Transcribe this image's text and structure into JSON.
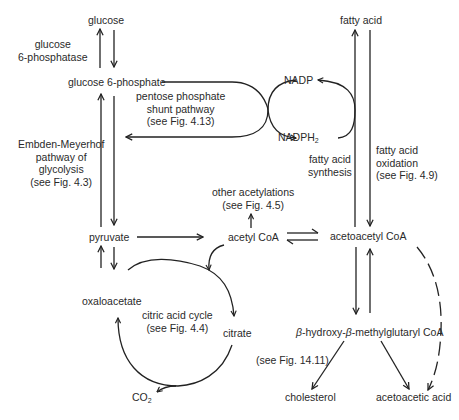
{
  "diagram": {
    "nodes": {
      "glucose": "glucose",
      "glucose_6_phosphate": "glucose 6-phosphate",
      "pyruvate": "pyruvate",
      "acetyl_coa": "acetyl CoA",
      "acetoacetyl_coa": "acetoacetyl CoA",
      "oxaloacetate": "oxaloacetate",
      "citrate": "citrate",
      "co2_main": "CO",
      "co2_sub": "2",
      "fatty_acid": "fatty acid",
      "nadp": "NADP",
      "nadph_main": "NADPH",
      "nadph_sub": "2",
      "hmg_beta1": "β",
      "hmg_part1": "-hydroxy-",
      "hmg_beta2": "β",
      "hmg_part2": "-methylglutaryl CoA",
      "cholesterol": "cholesterol",
      "acetoacetic_acid": "acetoacetic acid"
    },
    "annotations": {
      "glucose_6_phosphatase": [
        "glucose",
        "6-phosphatase"
      ],
      "pentose_shunt": [
        "pentose phosphate",
        "shunt pathway",
        "(see Fig. 4.13)"
      ],
      "glycolysis": [
        "Embden-Meyerhof",
        "pathway of",
        "glycolysis",
        "(see Fig. 4.3)"
      ],
      "fa_synthesis": [
        "fatty  acid",
        "synthesis"
      ],
      "fa_oxidation": [
        "fatty acid",
        "oxidation",
        "(see Fig. 4.9)"
      ],
      "other_acetylations": [
        "other acetylations",
        "(see Fig. 4.5)"
      ],
      "citric_acid_cycle": [
        "citric acid cycle",
        "(see Fig. 4.4)"
      ],
      "cholesterol_ref": "(see Fig. 14.11)"
    }
  }
}
